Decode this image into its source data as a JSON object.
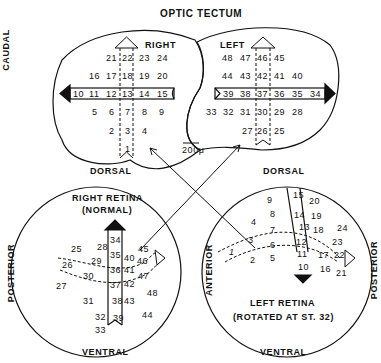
{
  "title": "OPTIC TECTUM",
  "axis_label": {
    "rostral": "ROSTRAL",
    "caudal": "CAUDAL"
  },
  "scale_bar": "200μ",
  "tectum": {
    "right": {
      "label": "RIGHT",
      "rows": [
        [
          "21",
          "22",
          "23",
          "24"
        ],
        [
          "16",
          "17",
          "18",
          "19",
          "20"
        ],
        [
          "10",
          "11",
          "12",
          "13",
          "14",
          "15"
        ],
        [
          "5",
          "6",
          "7",
          "8",
          "9"
        ],
        [
          "2",
          "3",
          "4"
        ],
        [
          "1"
        ]
      ]
    },
    "left": {
      "label": "LEFT",
      "rows": [
        [
          "48",
          "47",
          "46",
          "45"
        ],
        [
          "44",
          "43",
          "42",
          "41",
          "40"
        ],
        [
          "39",
          "38",
          "37",
          "36",
          "35",
          "34"
        ],
        [
          "33",
          "32",
          "31",
          "30",
          "29",
          "28"
        ],
        [
          "27",
          "26",
          "25"
        ]
      ]
    },
    "dorsal_left": "DORSAL",
    "dorsal_right": "DORSAL"
  },
  "right_retina": {
    "title": "RIGHT RETINA",
    "subtitle": "(NORMAL)",
    "posterior": "POSTERIOR",
    "ventral": "VENTRAL",
    "points": [
      "25",
      "26",
      "27",
      "28",
      "29",
      "30",
      "31",
      "32",
      "33",
      "34",
      "35",
      "36",
      "37",
      "38",
      "39",
      "40",
      "41",
      "42",
      "43",
      "44",
      "45",
      "46",
      "47",
      "48"
    ]
  },
  "left_retina": {
    "title": "LEFT RETINA",
    "subtitle": "(ROTATED AT ST. 32)",
    "anterior": "ANTERIOR",
    "posterior": "POSTERIOR",
    "ventral": "VENTRAL",
    "points": [
      "1",
      "2",
      "3",
      "4",
      "5",
      "6",
      "7",
      "8",
      "9",
      "10",
      "11",
      "12",
      "13",
      "14",
      "15",
      "16",
      "17",
      "18",
      "19",
      "20",
      "21",
      "22",
      "23",
      "24"
    ]
  }
}
